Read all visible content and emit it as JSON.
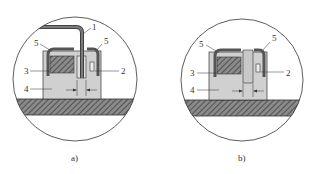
{
  "figure": {
    "panels": [
      {
        "id": "a",
        "caption": "a)",
        "labels": {
          "l1": "1",
          "l2": "2",
          "l3": "3",
          "l4": "4",
          "l5a": "5",
          "l5b": "5"
        }
      },
      {
        "id": "b",
        "caption": "b)",
        "labels": {
          "l2": "2",
          "l3": "3",
          "l4": "4",
          "l5a": "5",
          "l5b": "5"
        }
      }
    ],
    "colors": {
      "outline": "#333333",
      "base_fill": "#6e6e6e",
      "block_fill": "#d0d0d0",
      "clip_fill": "#7a7a7a",
      "hatch_fill": "#8a8a8a"
    }
  }
}
